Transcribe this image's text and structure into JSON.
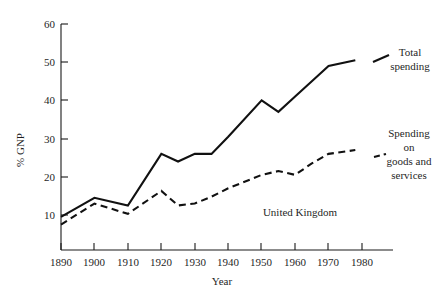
{
  "chart_data": {
    "type": "line",
    "title": "",
    "subtitle": "",
    "xlabel": "Year",
    "ylabel": "% GNP",
    "xlim": [
      1890,
      1980
    ],
    "ylim": [
      0,
      60
    ],
    "xticks": [
      1890,
      1900,
      1910,
      1920,
      1930,
      1940,
      1950,
      1960,
      1970,
      1980
    ],
    "xtick_labels": [
      "1890",
      "1900",
      "1910",
      "1920",
      "1930",
      "1940",
      "1950",
      "1960",
      "1970",
      "1980"
    ],
    "yticks": [
      10,
      20,
      30,
      40,
      50,
      60
    ],
    "ytick_labels": [
      "10",
      "20",
      "30",
      "40",
      "50",
      "60"
    ],
    "grid": false,
    "legend_position": "inline-annotations",
    "annotations": [
      {
        "name": "series-label-total-spending",
        "text": "Total spending",
        "lines": [
          "Total",
          "spending"
        ],
        "x": 1982,
        "y": 50
      },
      {
        "name": "series-label-goods-services",
        "text": "Spending on goods and services",
        "lines": [
          "Spending",
          "on",
          "goods and",
          "services"
        ],
        "x": 1982,
        "y": 27
      },
      {
        "name": "country-label",
        "text": "United Kingdom",
        "x": 1955,
        "y": 12
      }
    ],
    "series": [
      {
        "name": "Total spending",
        "style": "solid",
        "x": [
          1890,
          1900,
          1910,
          1920,
          1925,
          1930,
          1935,
          1940,
          1950,
          1955,
          1960,
          1965,
          1970,
          1978
        ],
        "values": [
          9.5,
          14.5,
          12.5,
          26.0,
          24.0,
          26.0,
          26.0,
          30.5,
          40.0,
          37.0,
          41.0,
          45.0,
          49.0,
          50.5
        ]
      },
      {
        "name": "Spending on goods and services",
        "style": "dashed",
        "x": [
          1890,
          1900,
          1910,
          1920,
          1925,
          1930,
          1935,
          1940,
          1950,
          1955,
          1960,
          1965,
          1970,
          1978
        ],
        "values": [
          7.5,
          13.0,
          10.3,
          16.3,
          12.5,
          13.0,
          14.8,
          17.0,
          20.5,
          21.5,
          20.5,
          23.5,
          26.0,
          27.0
        ]
      }
    ]
  },
  "figure": {
    "background_color": "#ffffff",
    "line_color": "#111111",
    "text_color": "#1f1f1f"
  }
}
